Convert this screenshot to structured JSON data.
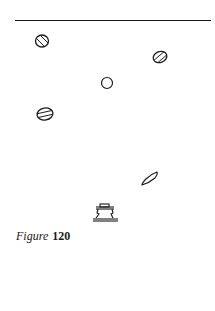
{
  "figure": {
    "caption": {
      "label": "Figure",
      "number": "120"
    },
    "stroke_color": "#1a1a1a",
    "background_color": "#ffffff",
    "objects": [
      {
        "id": "hatched-oval-top-left",
        "shape": "oval",
        "fill": "diagonal-hatching",
        "cx": 42,
        "cy": 41
      },
      {
        "id": "hatched-oval-top-right",
        "shape": "oval",
        "fill": "diagonal-hatching",
        "cx": 160,
        "cy": 57
      },
      {
        "id": "plain-circle",
        "shape": "circle",
        "fill": "none",
        "cx": 107,
        "cy": 83
      },
      {
        "id": "striped-oval",
        "shape": "oval",
        "fill": "two-stripes",
        "cx": 45,
        "cy": 114
      },
      {
        "id": "crescent",
        "shape": "crescent",
        "fill": "none",
        "cx": 149,
        "cy": 180
      },
      {
        "id": "bell-object",
        "shape": "bell",
        "fill": "none",
        "cx": 105,
        "cy": 214
      }
    ]
  }
}
